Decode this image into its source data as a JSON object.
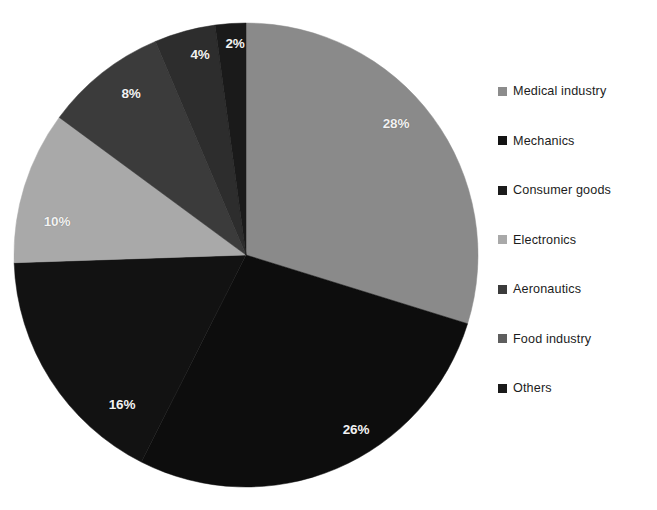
{
  "chart_data": {
    "type": "pie",
    "title": "",
    "subtitle": "",
    "xlabel": "",
    "ylabel": "",
    "grid": false,
    "legend_position": "right",
    "start_angle_deg": 0,
    "direction": "clockwise",
    "categories": [
      "Medical industry",
      "Mechanics",
      "Consumer goods",
      "Electronics",
      "Aeronautics",
      "Food industry",
      "Others"
    ],
    "values": [
      28,
      26,
      16,
      10,
      8,
      4,
      2
    ],
    "value_unit": "%",
    "data_labels": [
      "28%",
      "26%",
      "16%",
      "10%",
      "8%",
      "4%",
      "2%"
    ],
    "colors": [
      "#8a8a8a",
      "#0d0d0d",
      "#121212",
      "#a9a9a9",
      "#3b3b3b",
      "#2d2d2d",
      "#1a1a1a"
    ],
    "slices": [
      {
        "label": "Medical industry",
        "value": 28,
        "display": "28%",
        "color": "#8a8a8a",
        "label_x": 396,
        "label_y": 123
      },
      {
        "label": "Mechanics",
        "value": 26,
        "display": "26%",
        "color": "#0d0d0d",
        "label_x": 356,
        "label_y": 429
      },
      {
        "label": "Consumer goods",
        "value": 16,
        "display": "16%",
        "color": "#121212",
        "label_x": 122,
        "label_y": 404
      },
      {
        "label": "Electronics",
        "value": 10,
        "display": "10%",
        "color": "#a9a9a9",
        "label_x": 57,
        "label_y": 221
      },
      {
        "label": "Aeronautics",
        "value": 8,
        "display": "8%",
        "color": "#3b3b3b",
        "label_x": 131,
        "label_y": 93
      },
      {
        "label": "Food industry",
        "value": 4,
        "display": "4%",
        "color": "#2d2d2d",
        "label_x": 200,
        "label_y": 54
      },
      {
        "label": "Others",
        "value": 2,
        "display": "2%",
        "color": "#1a1a1a",
        "label_x": 235,
        "label_y": 43
      }
    ],
    "geometry": {
      "center_x": 246,
      "center_y": 255,
      "radius": 232
    }
  },
  "legend": {
    "items": [
      {
        "label": "Medical industry",
        "color": "#8c8c8c"
      },
      {
        "label": "Mechanics",
        "color": "#131313"
      },
      {
        "label": "Consumer goods",
        "color": "#1b1b1b"
      },
      {
        "label": "Electronics",
        "color": "#a9a9a9"
      },
      {
        "label": "Aeronautics",
        "color": "#3b3b3b"
      },
      {
        "label": "Food industry",
        "color": "#5e5e5e"
      },
      {
        "label": "Others",
        "color": "#1a1a1a"
      }
    ]
  },
  "colors": {
    "background": "#ffffff",
    "label_text": "#f2f2f2",
    "legend_text": "#1c1c1c"
  }
}
